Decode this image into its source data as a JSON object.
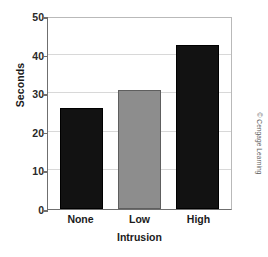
{
  "chart_data": {
    "type": "bar",
    "title": "",
    "categories": [
      "None",
      "Low",
      "High"
    ],
    "values": [
      26.2,
      30.8,
      42.5
    ],
    "xlabel": "Intrusion",
    "ylabel": "Seconds",
    "ylim": [
      0,
      50
    ],
    "yticks": [
      0,
      10,
      20,
      30,
      40,
      50
    ],
    "ytick_labels": [
      "0",
      "10",
      "20",
      "30",
      "40",
      "50"
    ],
    "grid": true,
    "legend": "none",
    "bar_colors": [
      "#121212",
      "#8d8d8d",
      "#121212"
    ],
    "series": [
      {
        "name": "Seconds",
        "values": [
          26.2,
          30.8,
          42.5
        ]
      }
    ]
  },
  "annotations": {
    "credit": "© Cengage Learning"
  }
}
